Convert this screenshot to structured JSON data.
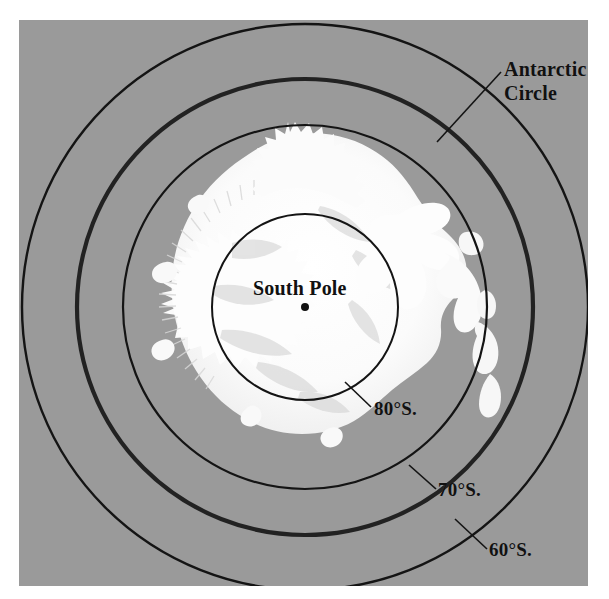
{
  "figure": {
    "ocean_color": "#9a9a9a",
    "land_color": "#ffffff",
    "line_color": "#141414"
  },
  "labels": {
    "antarctic_circle_line1": "Antarctic",
    "antarctic_circle_line2": "Circle",
    "south_pole": "South Pole",
    "lat_80": "80°S.",
    "lat_70": "70°S.",
    "lat_60": "60°S."
  },
  "map_data": {
    "type": "polar-projection",
    "center_label": "South Pole",
    "center_px": [
      305,
      307
    ],
    "latitude_circles": [
      {
        "name": "80°S.",
        "latitude": -80,
        "radius_px": 93,
        "stroke_px": 2.0,
        "emphasis": false
      },
      {
        "name": "70°S.",
        "latitude": -70,
        "radius_px": 182,
        "stroke_px": 2.2,
        "emphasis": false
      },
      {
        "name": "Antarctic Circle",
        "latitude": -66.5,
        "radius_px": 228,
        "stroke_px": 4.2,
        "emphasis": true
      },
      {
        "name": "60°S.",
        "latitude": -60,
        "radius_px": 283,
        "stroke_px": 2.4,
        "emphasis": false
      }
    ],
    "pole_marker": {
      "shape": "dot",
      "radius_px": 4
    },
    "landmass": "Antarctica"
  }
}
